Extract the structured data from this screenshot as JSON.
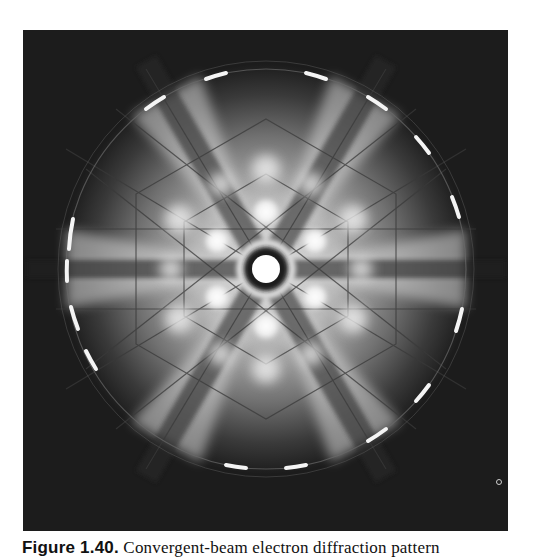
{
  "figure": {
    "label": "Figure 1.40.",
    "caption_text": "Convergent-beam electron diffraction pattern",
    "image_description": "Convergent-beam electron diffraction pattern with six-fold symmetry: bright central disk surrounded by a dark ring, six bright reflections in a hexagonal arrangement, radiating Kikuchi-like bands, and an outer ring of bright arcs (higher-order Laue zone).",
    "colors": {
      "background": "#1c1c1c",
      "bright": "#f2f2f2",
      "mid": "#8a8a8a",
      "page": "#ffffff"
    }
  }
}
